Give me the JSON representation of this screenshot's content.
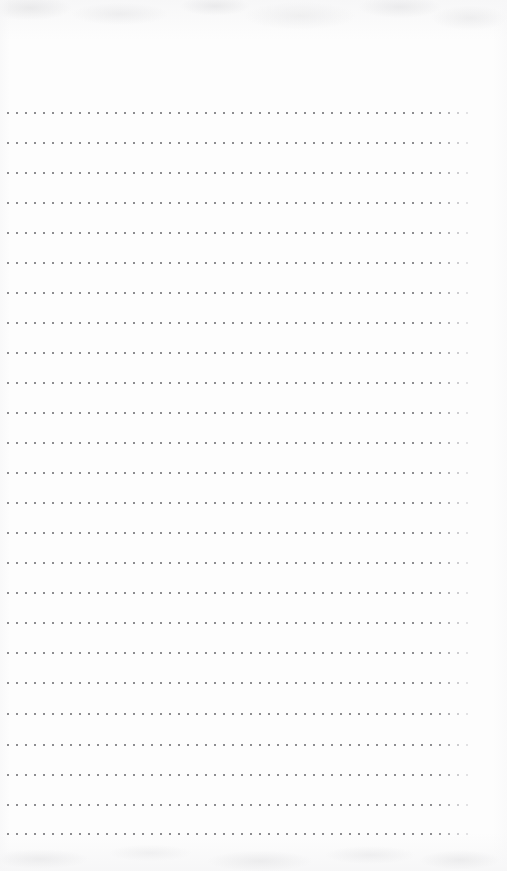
{
  "page": {
    "kind": "dotted-rule-notebook-page",
    "width": 507,
    "height": 871,
    "paper_color": "#fdfdfd",
    "dot_color": "#8d8d90",
    "text_content": "",
    "is_blank": true
  },
  "top_margin": {
    "label": "",
    "height": 108
  },
  "bottom_margin": {
    "label": "",
    "height": 30
  },
  "rules": {
    "label": "",
    "row_count": 25,
    "first_row_y": 112,
    "row_spacing": 30,
    "dot_start_x": 7,
    "dot_end_x": 470,
    "dot_spacing": 9,
    "dot_size": 2,
    "dots_per_row": 52,
    "fade_tail_count": 4,
    "rows": [
      {
        "index": 1,
        "y": 112
      },
      {
        "index": 2,
        "y": 142
      },
      {
        "index": 3,
        "y": 172
      },
      {
        "index": 4,
        "y": 202
      },
      {
        "index": 5,
        "y": 232
      },
      {
        "index": 6,
        "y": 262
      },
      {
        "index": 7,
        "y": 292
      },
      {
        "index": 8,
        "y": 322
      },
      {
        "index": 9,
        "y": 352
      },
      {
        "index": 10,
        "y": 382
      },
      {
        "index": 11,
        "y": 412
      },
      {
        "index": 12,
        "y": 442
      },
      {
        "index": 13,
        "y": 472
      },
      {
        "index": 14,
        "y": 502
      },
      {
        "index": 15,
        "y": 532
      },
      {
        "index": 16,
        "y": 562
      },
      {
        "index": 17,
        "y": 592
      },
      {
        "index": 18,
        "y": 622
      },
      {
        "index": 19,
        "y": 652
      },
      {
        "index": 20,
        "y": 682
      },
      {
        "index": 21,
        "y": 713
      },
      {
        "index": 22,
        "y": 744
      },
      {
        "index": 23,
        "y": 774
      },
      {
        "index": 24,
        "y": 804
      },
      {
        "index": 25,
        "y": 833
      }
    ]
  }
}
